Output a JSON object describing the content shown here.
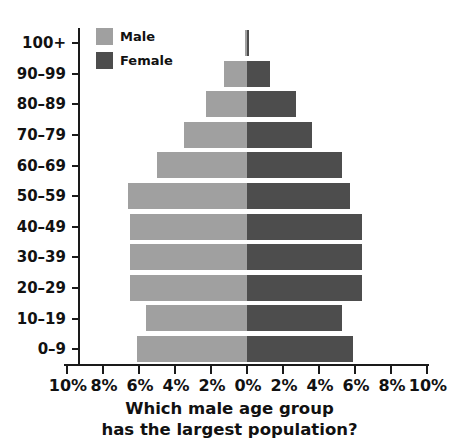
{
  "title": {
    "line1": "groups in a population, based on gender."
  },
  "question": {
    "line1": "Which male age group",
    "line2": "has the largest population?"
  },
  "legend": {
    "male_label": "Male",
    "female_label": "Female",
    "male_color": "#a0a0a0",
    "female_color": "#4d4d4d"
  },
  "axis": {
    "x_labels": [
      "10%",
      "8%",
      "6%",
      "4%",
      "2%",
      "0%",
      "2%",
      "4%",
      "6%",
      "8%",
      "10%"
    ],
    "x_values": [
      -10,
      -8,
      -6,
      -4,
      -2,
      0,
      2,
      4,
      6,
      8,
      10
    ]
  },
  "chart_data": {
    "type": "bar",
    "title": "groups in a population, based on gender.",
    "xlabel": "",
    "ylabel": "",
    "orientation": "horizontal",
    "layout": "population-pyramid",
    "grid": false,
    "legend_position": "top-left-inside",
    "categories": [
      "100+",
      "90–99",
      "80–89",
      "70–79",
      "60–69",
      "50–59",
      "40–49",
      "30–39",
      "20–29",
      "10–19",
      "0–9"
    ],
    "xlim": [
      -10,
      10
    ],
    "xticks": [
      -10,
      -8,
      -6,
      -4,
      -2,
      0,
      2,
      4,
      6,
      8,
      10
    ],
    "xtick_labels": [
      "10%",
      "8%",
      "6%",
      "4%",
      "2%",
      "0%",
      "2%",
      "4%",
      "6%",
      "8%",
      "10%"
    ],
    "series": [
      {
        "name": "Male",
        "color": "#a0a0a0",
        "side": "left",
        "values": [
          0.1,
          1.3,
          2.3,
          3.5,
          5.0,
          6.6,
          6.5,
          6.5,
          6.5,
          5.6,
          6.1
        ]
      },
      {
        "name": "Female",
        "color": "#4d4d4d",
        "side": "right",
        "values": [
          0.1,
          1.3,
          2.7,
          3.6,
          5.3,
          5.7,
          6.4,
          6.4,
          6.4,
          5.3,
          5.9
        ]
      }
    ]
  }
}
